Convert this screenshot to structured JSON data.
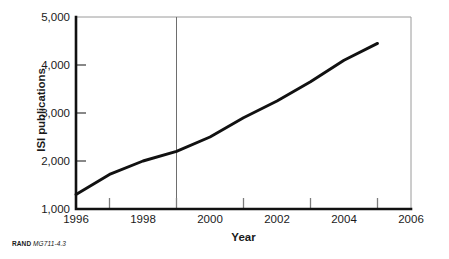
{
  "chart_data": {
    "type": "line",
    "title": "",
    "xlabel": "Year",
    "ylabel": "ISI publications",
    "xlim": [
      1996,
      2006
    ],
    "ylim": [
      1000,
      5000
    ],
    "grid": false,
    "legend": null,
    "x_tick_labels": [
      "1996",
      "1998",
      "2000",
      "2002",
      "2004",
      "2006"
    ],
    "x_tick_values": [
      1996,
      1998,
      2000,
      2002,
      2004,
      2006
    ],
    "x_minor_tick_values": [
      1997,
      1999,
      2001,
      2003,
      2005
    ],
    "y_tick_labels": [
      "1,000",
      "2,000",
      "3,000",
      "4,000",
      "5,000"
    ],
    "y_tick_values": [
      1000,
      2000,
      3000,
      4000,
      5000
    ],
    "annotations": [
      {
        "name": "reference-line-1999",
        "type": "vline",
        "x": 1999
      }
    ],
    "series": [
      {
        "name": "ISI publications",
        "color": "#111111",
        "x": [
          1996,
          1997,
          1998,
          1999,
          2000,
          2001,
          2002,
          2003,
          2004,
          2005
        ],
        "values": [
          1300,
          1720,
          2000,
          2200,
          2500,
          2900,
          3250,
          3650,
          4100,
          4450
        ]
      }
    ]
  },
  "labels": {
    "x_axis_title": "Year",
    "y_axis_title": "ISI publications"
  },
  "caption": {
    "organization": "RAND",
    "figure_id": "MG711-4.3"
  },
  "colors": {
    "line": "#111111",
    "axis": "#111111",
    "frame": "#9a9a9a",
    "reference_line": "#6e6e6e",
    "background": "#ffffff"
  }
}
